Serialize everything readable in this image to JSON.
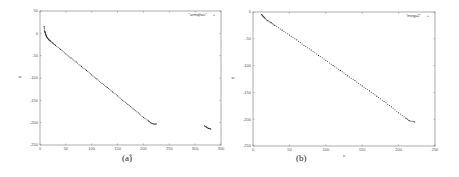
{
  "chart_data": [
    {
      "type": "scatter",
      "panel_label": "(a)",
      "legend": "\"armqhac\"",
      "xlabel": "n",
      "ylabel": "w",
      "xlim": [
        0,
        350
      ],
      "ylim": [
        -250,
        50
      ],
      "xticks": [
        0,
        50,
        100,
        150,
        200,
        250,
        300,
        350
      ],
      "yticks": [
        50,
        0,
        -50,
        -100,
        -150,
        -200,
        -250
      ],
      "grid": false,
      "legend_position": "top-right",
      "series": [
        {
          "name": "armqhac",
          "points": [
            [
              8,
              15
            ],
            [
              9,
              5
            ],
            [
              10,
              2
            ],
            [
              11,
              -2
            ],
            [
              12,
              -5
            ],
            [
              13,
              -8
            ],
            [
              15,
              -11
            ],
            [
              17,
              -14
            ],
            [
              20,
              -17
            ],
            [
              25,
              -22
            ],
            [
              30,
              -27
            ],
            [
              40,
              -36
            ],
            [
              50,
              -46
            ],
            [
              60,
              -55
            ],
            [
              70,
              -64
            ],
            [
              80,
              -74
            ],
            [
              90,
              -83
            ],
            [
              100,
              -93
            ],
            [
              110,
              -102
            ],
            [
              120,
              -112
            ],
            [
              130,
              -121
            ],
            [
              140,
              -131
            ],
            [
              150,
              -140
            ],
            [
              160,
              -150
            ],
            [
              170,
              -159
            ],
            [
              180,
              -169
            ],
            [
              190,
              -178
            ],
            [
              200,
              -188
            ],
            [
              210,
              -196
            ],
            [
              215,
              -201
            ],
            [
              220,
              -203
            ],
            [
              225,
              -203
            ],
            [
              318,
              -207
            ],
            [
              322,
              -210
            ],
            [
              326,
              -213
            ],
            [
              330,
              -214
            ]
          ]
        }
      ]
    },
    {
      "type": "scatter",
      "panel_label": "(b)",
      "legend": "\"mega2\"",
      "xlabel": "n",
      "ylabel": "w",
      "xlim": [
        0,
        250
      ],
      "ylim": [
        -250,
        0
      ],
      "xticks": [
        0,
        50,
        100,
        150,
        200,
        250
      ],
      "yticks": [
        0,
        -50,
        -100,
        -150,
        -200,
        -250
      ],
      "grid": false,
      "legend_position": "top-right",
      "series": [
        {
          "name": "mega2",
          "points": [
            [
              12,
              -5
            ],
            [
              14,
              -8
            ],
            [
              16,
              -11
            ],
            [
              20,
              -16
            ],
            [
              25,
              -20
            ],
            [
              30,
              -25
            ],
            [
              40,
              -34
            ],
            [
              50,
              -43
            ],
            [
              60,
              -52
            ],
            [
              70,
              -62
            ],
            [
              80,
              -71
            ],
            [
              90,
              -81
            ],
            [
              100,
              -90
            ],
            [
              110,
              -100
            ],
            [
              120,
              -109
            ],
            [
              130,
              -119
            ],
            [
              140,
              -128
            ],
            [
              150,
              -138
            ],
            [
              160,
              -147
            ],
            [
              170,
              -157
            ],
            [
              180,
              -167
            ],
            [
              190,
              -177
            ],
            [
              200,
              -188
            ],
            [
              210,
              -198
            ],
            [
              215,
              -203
            ],
            [
              222,
              -205
            ]
          ]
        }
      ]
    }
  ]
}
